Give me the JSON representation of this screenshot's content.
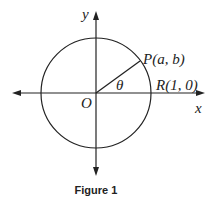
{
  "figure": {
    "caption": "Figure 1",
    "labels": {
      "y_axis": "y",
      "x_axis": "x",
      "origin": "O",
      "point_p": "P(a, b)",
      "point_r": "R(1, 0)",
      "angle": "θ"
    },
    "elements": {
      "circle": "unit circle centered at origin O",
      "radius_segment": "segment from O to P",
      "axes": "x and y axes with arrowheads at both ends"
    }
  }
}
